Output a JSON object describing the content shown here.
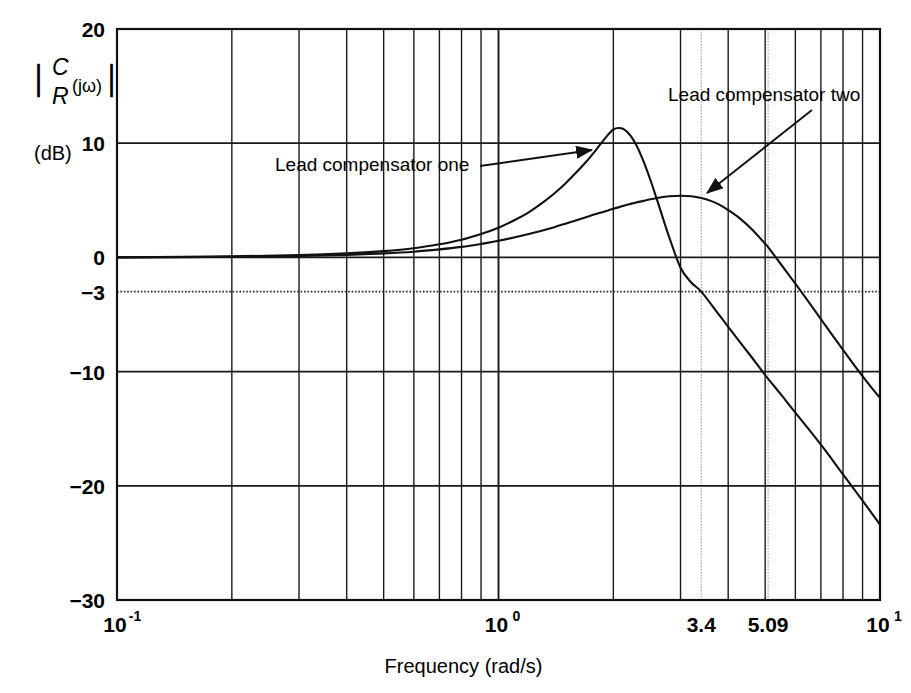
{
  "chart_data": {
    "type": "line",
    "title": "",
    "xlabel": "Frequency (rad/s)",
    "ylabel": "|C/R (jω)|",
    "ylabel_units": "(dB)",
    "xscale": "log",
    "xlim": [
      0.1,
      10
    ],
    "ylim": [
      -30,
      20
    ],
    "grid": true,
    "x_tick_labels": [
      "10",
      "10",
      "3.4",
      "5.09",
      "10"
    ],
    "x_tick_exponents": [
      "-1",
      "0",
      "",
      "",
      "1"
    ],
    "x_tick_values": [
      0.1,
      1.0,
      3.4,
      5.09,
      10.0
    ],
    "x_tick_bold": [
      false,
      false,
      false,
      true,
      false
    ],
    "y_tick_labels": [
      "20",
      "10",
      "0",
      "−3",
      "−10",
      "−20",
      "−30"
    ],
    "y_tick_values": [
      20,
      10,
      0,
      -3,
      -10,
      -20,
      -30
    ],
    "reference_line": {
      "value": -3,
      "style": "dotted",
      "label": "−3"
    },
    "series": [
      {
        "name": "Lead compensator one",
        "peak_db": 11.3,
        "peak_freq": 2.0,
        "bandwidth_minus3db": 3.4,
        "points": [
          [
            0.1,
            0.0
          ],
          [
            0.15,
            0.05
          ],
          [
            0.2,
            0.1
          ],
          [
            0.3,
            0.2
          ],
          [
            0.4,
            0.35
          ],
          [
            0.5,
            0.55
          ],
          [
            0.6,
            0.8
          ],
          [
            0.7,
            1.15
          ],
          [
            0.8,
            1.55
          ],
          [
            0.9,
            2.05
          ],
          [
            1.0,
            2.6
          ],
          [
            1.1,
            3.25
          ],
          [
            1.2,
            3.95
          ],
          [
            1.3,
            4.75
          ],
          [
            1.4,
            5.6
          ],
          [
            1.5,
            6.5
          ],
          [
            1.6,
            7.45
          ],
          [
            1.7,
            8.4
          ],
          [
            1.8,
            9.4
          ],
          [
            1.9,
            10.4
          ],
          [
            2.0,
            11.2
          ],
          [
            2.1,
            11.3
          ],
          [
            2.2,
            10.8
          ],
          [
            2.3,
            9.8
          ],
          [
            2.4,
            8.4
          ],
          [
            2.5,
            6.8
          ],
          [
            2.6,
            5.1
          ],
          [
            2.7,
            3.4
          ],
          [
            2.8,
            1.8
          ],
          [
            3.0,
            -0.9
          ],
          [
            3.2,
            -2.2
          ],
          [
            3.4,
            -3.0
          ],
          [
            3.8,
            -5.1
          ],
          [
            4.2,
            -7.0
          ],
          [
            4.6,
            -8.7
          ],
          [
            5.0,
            -10.3
          ],
          [
            5.5,
            -12.0
          ],
          [
            6.0,
            -13.6
          ],
          [
            7.0,
            -16.4
          ],
          [
            8.0,
            -19.0
          ],
          [
            9.0,
            -21.3
          ],
          [
            10.0,
            -23.4
          ]
        ]
      },
      {
        "name": "Lead compensator two",
        "peak_db": 5.4,
        "peak_freq": 3.0,
        "bandwidth_minus3db": 5.09,
        "points": [
          [
            0.1,
            0.0
          ],
          [
            0.15,
            0.02
          ],
          [
            0.2,
            0.05
          ],
          [
            0.3,
            0.12
          ],
          [
            0.4,
            0.22
          ],
          [
            0.5,
            0.35
          ],
          [
            0.6,
            0.5
          ],
          [
            0.7,
            0.7
          ],
          [
            0.8,
            0.92
          ],
          [
            0.9,
            1.18
          ],
          [
            1.0,
            1.45
          ],
          [
            1.2,
            2.05
          ],
          [
            1.4,
            2.65
          ],
          [
            1.6,
            3.25
          ],
          [
            1.8,
            3.8
          ],
          [
            2.0,
            4.25
          ],
          [
            2.2,
            4.65
          ],
          [
            2.4,
            4.95
          ],
          [
            2.6,
            5.2
          ],
          [
            2.8,
            5.35
          ],
          [
            3.0,
            5.4
          ],
          [
            3.2,
            5.35
          ],
          [
            3.4,
            5.2
          ],
          [
            3.6,
            4.95
          ],
          [
            3.8,
            4.6
          ],
          [
            4.0,
            4.15
          ],
          [
            4.3,
            3.4
          ],
          [
            4.6,
            2.5
          ],
          [
            5.0,
            1.2
          ],
          [
            5.09,
            0.9
          ],
          [
            5.5,
            -0.6
          ],
          [
            6.0,
            -2.3
          ],
          [
            6.5,
            -3.9
          ],
          [
            7.0,
            -5.4
          ],
          [
            7.5,
            -6.8
          ],
          [
            8.0,
            -8.1
          ],
          [
            8.5,
            -9.3
          ],
          [
            9.0,
            -10.4
          ],
          [
            9.5,
            -11.4
          ],
          [
            10.0,
            -12.3
          ]
        ]
      }
    ],
    "annotations": [
      {
        "text": "Lead compensator one",
        "text_x": 275,
        "text_y": 171,
        "arrow_from_x": 480,
        "arrow_from_y": 166,
        "arrow_to_x": 592,
        "arrow_to_y": 150
      },
      {
        "text": "Lead compensator two",
        "text_x": 668,
        "text_y": 101,
        "arrow_from_x": 812,
        "arrow_from_y": 110,
        "arrow_to_x": 707,
        "arrow_to_y": 193
      }
    ]
  },
  "ylabel_parts": {
    "numerator": "C",
    "denominator": "R",
    "arg": "(jω)",
    "units": "(dB)",
    "bar": "∣"
  }
}
